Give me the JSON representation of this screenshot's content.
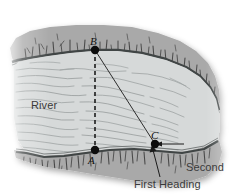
{
  "figure": {
    "background_color": "#ffffff",
    "water_color": "#d6d9d9",
    "bank_color": "#a9a9a9",
    "bank_edge_color": "#3f4444",
    "ink_color": "#1a1a1a",
    "label_color": "#3a3a3a"
  },
  "labels": {
    "river": "River",
    "second_heading_line1": "Second",
    "second_heading_line2": "Heading",
    "first_heading": "First Heading"
  },
  "points": {
    "a": {
      "label": "A",
      "x": 95,
      "y": 150
    },
    "b": {
      "label": "B",
      "x": 95,
      "y": 50
    },
    "c": {
      "label": "C",
      "x": 155,
      "y": 144
    }
  },
  "lines": {
    "ab": {
      "style": "dashed",
      "from": "B",
      "to": "A"
    },
    "bc": {
      "style": "solid",
      "from": "B",
      "to": "C"
    },
    "second_heading_arrow": {
      "style": "solid-arrow",
      "from": "Second Heading",
      "to": "C"
    },
    "first_heading_leader": {
      "style": "solid-leader",
      "from": "First Heading",
      "to": "C"
    }
  },
  "icons": {
    "point_marker": "filled-circle-marker",
    "arrow_head": "arrow-head-icon"
  }
}
